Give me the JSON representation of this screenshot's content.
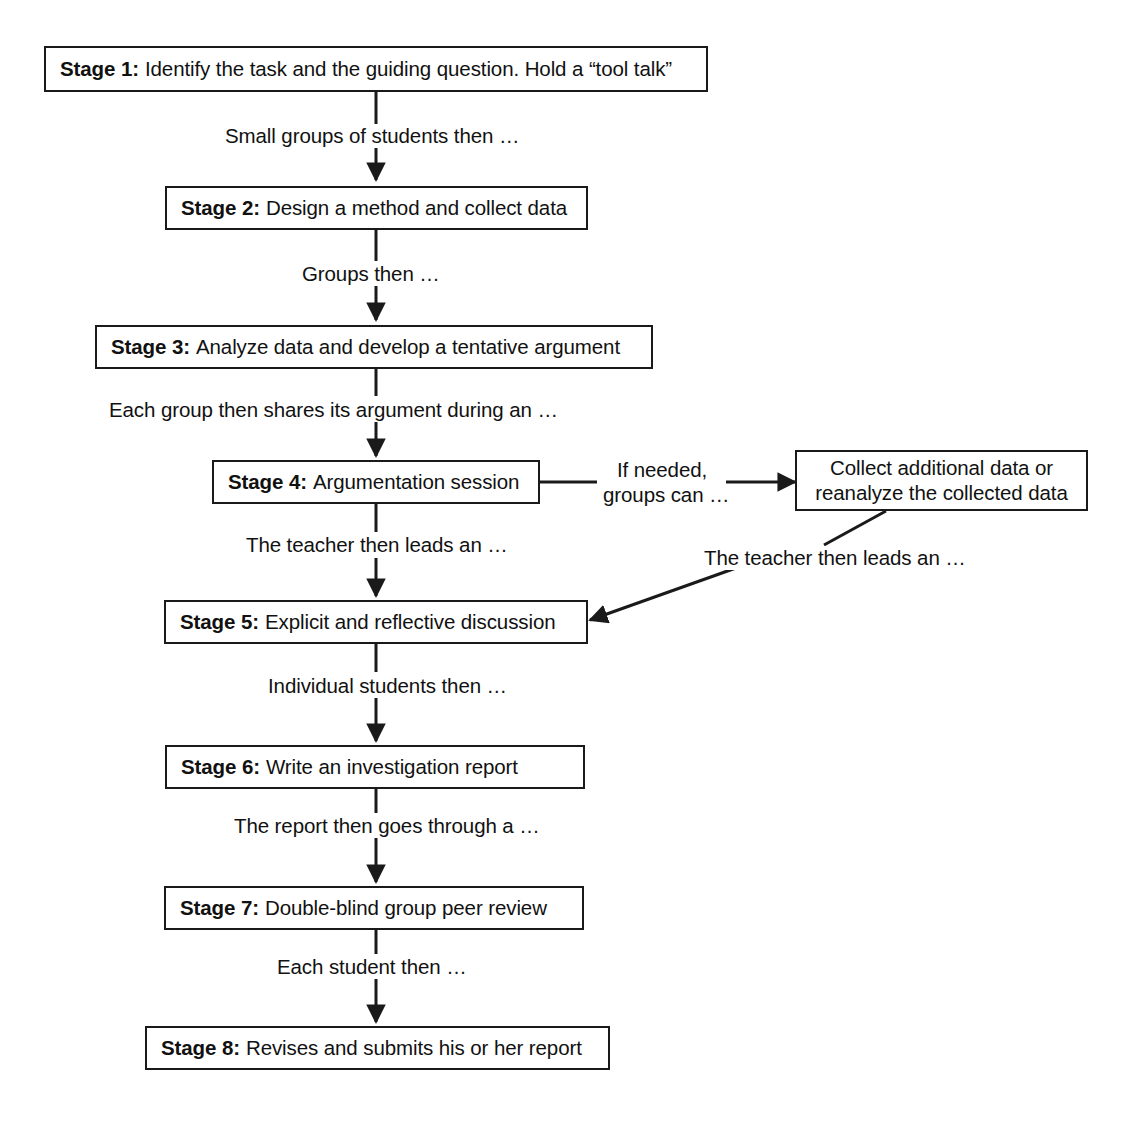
{
  "diagram": {
    "type": "flowchart",
    "orientation": "top-to-bottom",
    "title": "",
    "nodes": [
      {
        "id": "stage1",
        "stage_label": "Stage 1:",
        "text": "Identify the task and the guiding question. Hold a “tool talk”"
      },
      {
        "id": "stage2",
        "stage_label": "Stage 2:",
        "text": "Design a method and collect data"
      },
      {
        "id": "stage3",
        "stage_label": "Stage 3:",
        "text": "Analyze data and develop a tentative argument"
      },
      {
        "id": "stage4",
        "stage_label": "Stage 4:",
        "text": "Argumentation session"
      },
      {
        "id": "collect",
        "stage_label": "",
        "text_line1": "Collect additional data or",
        "text_line2": "reanalyze the collected data"
      },
      {
        "id": "stage5",
        "stage_label": "Stage 5:",
        "text": "Explicit and reflective discussion"
      },
      {
        "id": "stage6",
        "stage_label": "Stage 6:",
        "text": "Write an investigation report"
      },
      {
        "id": "stage7",
        "stage_label": "Stage 7:",
        "text": "Double-blind group peer review"
      },
      {
        "id": "stage8",
        "stage_label": "Stage 8:",
        "text": "Revises and submits his or her report"
      }
    ],
    "edge_labels": {
      "s1_s2": "Small groups of students then …",
      "s2_s3": "Groups then …",
      "s3_s4": "Each group then shares its argument during an …",
      "s4_collect_line1": "If needed,",
      "s4_collect_line2": "groups can …",
      "s4_s5": "The teacher then leads an …",
      "collect_s5": "The teacher then leads an …",
      "s5_s6": "Individual students then …",
      "s6_s7": "The report then goes through a …",
      "s7_s8": "Each student then …"
    },
    "colors": {
      "stroke": "#1a1a1a",
      "text": "#111111",
      "background": "#ffffff"
    }
  }
}
